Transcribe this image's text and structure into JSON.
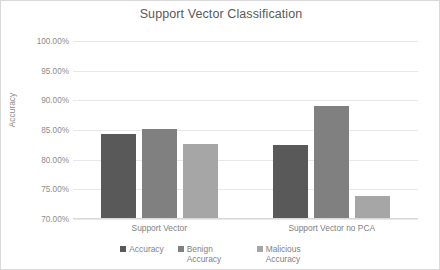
{
  "chart_data": {
    "type": "bar",
    "title": "Support Vector Classification",
    "xlabel": "",
    "ylabel": "Accuracy",
    "categories": [
      "Support Vector",
      "Support Vector no PCA"
    ],
    "series": [
      {
        "name": "Accuracy",
        "values": [
          84.3,
          82.5
        ],
        "color": "#595959"
      },
      {
        "name": "Benign Accuracy",
        "values": [
          85.2,
          89.1
        ],
        "color": "#808080"
      },
      {
        "name": "Malicious Accuracy",
        "values": [
          82.6,
          73.9
        ],
        "color": "#a6a6a6"
      }
    ],
    "ylim": [
      70.0,
      100.0
    ],
    "ytick_values": [
      100.0,
      95.0,
      90.0,
      85.0,
      80.0,
      75.0,
      70.0
    ],
    "ytick_labels": [
      "100.00%",
      "95.00%",
      "90.00%",
      "85.00%",
      "80.00%",
      "75.00%",
      "70.00%"
    ],
    "grid": true,
    "legend_position": "bottom"
  },
  "legend": {
    "items": [
      {
        "label": "Accuracy",
        "color": "#595959"
      },
      {
        "label": "Benign Accuracy",
        "color": "#808080"
      },
      {
        "label": "Malicious Accuracy",
        "color": "#a6a6a6"
      }
    ]
  },
  "colors": {
    "accuracy": "#595959",
    "benign_accuracy": "#808080",
    "malicious_accuracy": "#a6a6a6",
    "gridline": "#e8e8e8",
    "text": "#7f7f7f",
    "border": "#d9d9d9"
  }
}
